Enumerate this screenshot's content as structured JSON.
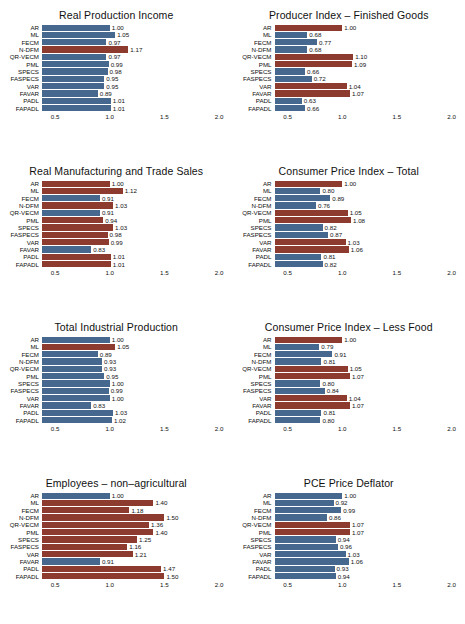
{
  "figure": {
    "methods": [
      "AR",
      "ML",
      "FECM",
      "N-DFM",
      "QR-VECM",
      "PML",
      "SPECS",
      "FASPECS",
      "VAR",
      "FAVAR",
      "PADL",
      "FAPADL"
    ],
    "axis_ticks": [
      "0.5",
      "1.0",
      "1.5",
      "2.0"
    ],
    "axis_values": [
      0.5,
      1.0,
      1.5,
      2.0
    ],
    "xlim": [
      0.38,
      2.05
    ],
    "colors": {
      "blue": "#46688f",
      "red": "#8c3b2e",
      "text": "#111111",
      "background": "#ffffff"
    }
  },
  "chart_data": [
    {
      "type": "bar",
      "title": "Real Production Income",
      "orientation": "horizontal",
      "categories": [
        "AR",
        "ML",
        "FECM",
        "N-DFM",
        "QR-VECM",
        "PML",
        "SPECS",
        "FASPECS",
        "VAR",
        "FAVAR",
        "PADL",
        "FAPADL"
      ],
      "values": [
        1.0,
        1.05,
        0.97,
        1.17,
        0.97,
        0.99,
        0.98,
        0.95,
        0.95,
        0.89,
        1.01,
        1.01
      ],
      "labels": [
        "1.00",
        "1.05",
        "0.97",
        "1.17",
        "0.97",
        "0.99",
        "0.98",
        "0.95",
        "0.95",
        "0.89",
        "1.01",
        "1.01"
      ],
      "highlight": [
        false,
        false,
        false,
        true,
        false,
        false,
        false,
        false,
        false,
        false,
        false,
        false
      ],
      "xlabel": "",
      "ylabel": "",
      "xlim": [
        0.38,
        2.05
      ],
      "xticks": [
        0.5,
        1.0,
        1.5,
        2.0
      ],
      "xticklabels": [
        "0.5",
        "1.0",
        "1.5",
        "2.0"
      ],
      "grid": false,
      "legend": "none"
    },
    {
      "type": "bar",
      "title": "Producer Index – Finished Goods",
      "orientation": "horizontal",
      "categories": [
        "AR",
        "ML",
        "FECM",
        "N-DFM",
        "QR-VECM",
        "PML",
        "SPECS",
        "FASPECS",
        "VAR",
        "FAVAR",
        "PADL",
        "FAPADL"
      ],
      "values": [
        1.0,
        0.68,
        0.77,
        0.68,
        1.1,
        1.09,
        0.66,
        0.72,
        1.04,
        1.07,
        0.63,
        0.66
      ],
      "labels": [
        "1.00",
        "0.68",
        "0.77",
        "0.68",
        "1.10",
        "1.09",
        "0.66",
        "0.72",
        "1.04",
        "1.07",
        "0.63",
        "0.66"
      ],
      "highlight": [
        true,
        false,
        false,
        false,
        true,
        true,
        false,
        false,
        true,
        true,
        false,
        false
      ],
      "xlabel": "",
      "ylabel": "",
      "xlim": [
        0.38,
        2.05
      ],
      "xticks": [
        0.5,
        1.0,
        1.5,
        2.0
      ],
      "xticklabels": [
        "0.5",
        "1.0",
        "1.5",
        "2.0"
      ],
      "grid": false,
      "legend": "none"
    },
    {
      "type": "bar",
      "title": "Real Manufacturing and Trade Sales",
      "orientation": "horizontal",
      "categories": [
        "AR",
        "ML",
        "FECM",
        "N-DFM",
        "QR-VECM",
        "PML",
        "SPECS",
        "FASPECS",
        "VAR",
        "FAVAR",
        "PADL",
        "FAPADL"
      ],
      "values": [
        1.0,
        1.12,
        0.91,
        1.03,
        0.91,
        0.94,
        1.03,
        0.98,
        0.99,
        0.83,
        1.01,
        1.01
      ],
      "labels": [
        "1.00",
        "1.12",
        "0.91",
        "1.03",
        "0.91",
        "0.94",
        "1.03",
        "0.98",
        "0.99",
        "0.83",
        "1.01",
        "1.01"
      ],
      "highlight": [
        true,
        true,
        false,
        true,
        false,
        true,
        true,
        true,
        true,
        false,
        true,
        true
      ],
      "xlabel": "",
      "ylabel": "",
      "xlim": [
        0.38,
        2.05
      ],
      "xticks": [
        0.5,
        1.0,
        1.5,
        2.0
      ],
      "xticklabels": [
        "0.5",
        "1.0",
        "1.5",
        "2.0"
      ],
      "grid": false,
      "legend": "none"
    },
    {
      "type": "bar",
      "title": "Consumer Price Index – Total",
      "orientation": "horizontal",
      "categories": [
        "AR",
        "ML",
        "FECM",
        "N-DFM",
        "QR-VECM",
        "PML",
        "SPECS",
        "FASPECS",
        "VAR",
        "FAVAR",
        "PADL",
        "FAPADL"
      ],
      "values": [
        1.0,
        0.8,
        0.89,
        0.76,
        1.05,
        1.08,
        0.82,
        0.87,
        1.03,
        1.06,
        0.81,
        0.82
      ],
      "labels": [
        "1.00",
        "0.80",
        "0.89",
        "0.76",
        "1.05",
        "1.08",
        "0.82",
        "0.87",
        "1.03",
        "1.06",
        "0.81",
        "0.82"
      ],
      "highlight": [
        true,
        false,
        false,
        false,
        true,
        true,
        false,
        false,
        true,
        true,
        false,
        false
      ],
      "xlabel": "",
      "ylabel": "",
      "xlim": [
        0.38,
        2.05
      ],
      "xticks": [
        0.5,
        1.0,
        1.5,
        2.0
      ],
      "xticklabels": [
        "0.5",
        "1.0",
        "1.5",
        "2.0"
      ],
      "grid": false,
      "legend": "none"
    },
    {
      "type": "bar",
      "title": "Total Industrial Production",
      "orientation": "horizontal",
      "categories": [
        "AR",
        "ML",
        "FECM",
        "N-DFM",
        "QR-VECM",
        "PML",
        "SPECS",
        "FASPECS",
        "VAR",
        "FAVAR",
        "PADL",
        "FAPADL"
      ],
      "values": [
        1.0,
        1.05,
        0.89,
        0.93,
        0.93,
        0.95,
        1.0,
        0.99,
        1.0,
        0.83,
        1.03,
        1.02
      ],
      "labels": [
        "1.00",
        "1.05",
        "0.89",
        "0.93",
        "0.93",
        "0.95",
        "1.00",
        "0.99",
        "1.00",
        "0.83",
        "1.03",
        "1.02"
      ],
      "highlight": [
        false,
        true,
        false,
        false,
        false,
        false,
        false,
        false,
        false,
        false,
        false,
        false
      ],
      "xlabel": "",
      "ylabel": "",
      "xlim": [
        0.38,
        2.05
      ],
      "xticks": [
        0.5,
        1.0,
        1.5,
        2.0
      ],
      "xticklabels": [
        "0.5",
        "1.0",
        "1.5",
        "2.0"
      ],
      "grid": false,
      "legend": "none"
    },
    {
      "type": "bar",
      "title": "Consumer Price Index – Less Food",
      "orientation": "horizontal",
      "categories": [
        "AR",
        "ML",
        "FECM",
        "N-DFM",
        "QR-VECM",
        "PML",
        "SPECS",
        "FASPECS",
        "VAR",
        "FAVAR",
        "PADL",
        "FAPADL"
      ],
      "values": [
        1.0,
        0.79,
        0.91,
        0.81,
        1.05,
        1.07,
        0.8,
        0.84,
        1.04,
        1.07,
        0.81,
        0.8
      ],
      "labels": [
        "1.00",
        "0.79",
        "0.91",
        "0.81",
        "1.05",
        "1.07",
        "0.80",
        "0.84",
        "1.04",
        "1.07",
        "0.81",
        "0.80"
      ],
      "highlight": [
        true,
        false,
        false,
        false,
        true,
        true,
        false,
        false,
        true,
        true,
        false,
        false
      ],
      "xlabel": "",
      "ylabel": "",
      "xlim": [
        0.38,
        2.05
      ],
      "xticks": [
        0.5,
        1.0,
        1.5,
        2.0
      ],
      "xticklabels": [
        "0.5",
        "1.0",
        "1.5",
        "2.0"
      ],
      "grid": false,
      "legend": "none"
    },
    {
      "type": "bar",
      "title": "Employees – non–agricultural",
      "orientation": "horizontal",
      "categories": [
        "AR",
        "ML",
        "FECM",
        "N-DFM",
        "QR-VECM",
        "PML",
        "SPECS",
        "FASPECS",
        "VAR",
        "FAVAR",
        "PADL",
        "FAPADL"
      ],
      "values": [
        1.0,
        1.4,
        1.18,
        1.5,
        1.36,
        1.4,
        1.25,
        1.16,
        1.21,
        0.91,
        1.47,
        1.5
      ],
      "labels": [
        "1.00",
        "1.40",
        "1.18",
        "1.50",
        "1.36",
        "1.40",
        "1.25",
        "1.16",
        "1.21",
        "0.91",
        "1.47",
        "1.50"
      ],
      "highlight": [
        false,
        true,
        true,
        true,
        true,
        true,
        true,
        true,
        true,
        false,
        true,
        true
      ],
      "xlabel": "",
      "ylabel": "",
      "xlim": [
        0.38,
        2.05
      ],
      "xticks": [
        0.5,
        1.0,
        1.5,
        2.0
      ],
      "xticklabels": [
        "0.5",
        "1.0",
        "1.5",
        "2.0"
      ],
      "grid": false,
      "legend": "none"
    },
    {
      "type": "bar",
      "title": "PCE Price Deflator",
      "orientation": "horizontal",
      "categories": [
        "AR",
        "ML",
        "FECM",
        "N-DFM",
        "QR-VECM",
        "PML",
        "SPECS",
        "FASPECS",
        "VAR",
        "FAVAR",
        "PADL",
        "FAPADL"
      ],
      "values": [
        1.0,
        0.92,
        0.99,
        0.86,
        1.07,
        1.07,
        0.94,
        0.96,
        1.03,
        1.06,
        0.93,
        0.94
      ],
      "labels": [
        "1.00",
        "0.92",
        "0.99",
        "0.86",
        "1.07",
        "1.07",
        "0.94",
        "0.96",
        "1.03",
        "1.06",
        "0.93",
        "0.94"
      ],
      "highlight": [
        false,
        false,
        false,
        false,
        true,
        true,
        false,
        false,
        false,
        false,
        false,
        false
      ],
      "xlabel": "",
      "ylabel": "",
      "xlim": [
        0.38,
        2.05
      ],
      "xticks": [
        0.5,
        1.0,
        1.5,
        2.0
      ],
      "xticklabels": [
        "0.5",
        "1.0",
        "1.5",
        "2.0"
      ],
      "grid": false,
      "legend": "none"
    }
  ]
}
